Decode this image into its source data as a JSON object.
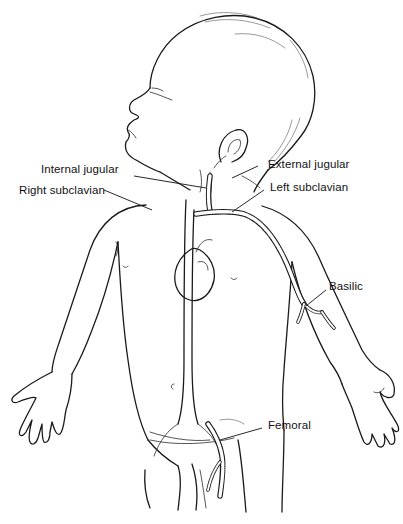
{
  "figure": {
    "colors": {
      "ink": "#1a1a1a",
      "background": "#ffffff"
    },
    "labels": {
      "internal_jugular": "Internal jugular",
      "right_subclavian": "Right subclavian",
      "external_jugular": "External jugular",
      "left_subclavian": "Left subclavian",
      "basilic": "Basilic",
      "femoral": "Femoral"
    }
  }
}
